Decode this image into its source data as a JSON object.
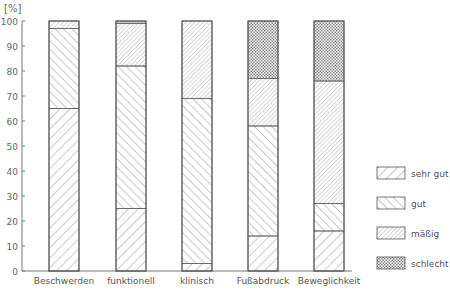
{
  "chart_data": {
    "type": "bar",
    "stacked": true,
    "title": "",
    "xlabel": "",
    "ylabel": "[%]",
    "ylim": [
      0,
      100
    ],
    "yticks": [
      0,
      10,
      20,
      30,
      40,
      50,
      60,
      70,
      80,
      90,
      100
    ],
    "grid": false,
    "legend_position": "right",
    "categories": [
      "Beschwerden",
      "funktionell",
      "klinisch",
      "Fußabdruck",
      "Beweglichkeit"
    ],
    "series": [
      {
        "name": "sehr gut",
        "pattern": "wide-forward-hatch",
        "values": [
          65,
          25,
          3,
          14,
          16
        ]
      },
      {
        "name": "gut",
        "pattern": "backward-hatch",
        "values": [
          32,
          57,
          66,
          44,
          11
        ]
      },
      {
        "name": "mäßig",
        "pattern": "dense-forward-hatch",
        "values": [
          3,
          17,
          31,
          19,
          49
        ]
      },
      {
        "name": "schlecht",
        "pattern": "crosshatch",
        "values": [
          0,
          1,
          0,
          23,
          24
        ]
      }
    ]
  },
  "legend": {
    "items": [
      {
        "label": "sehr gut",
        "pattern": "sg"
      },
      {
        "label": "gut",
        "pattern": "g"
      },
      {
        "label": "mäßig",
        "pattern": "m"
      },
      {
        "label": "schlecht",
        "pattern": "s"
      }
    ]
  },
  "axis": {
    "y_unit": "[%]"
  }
}
